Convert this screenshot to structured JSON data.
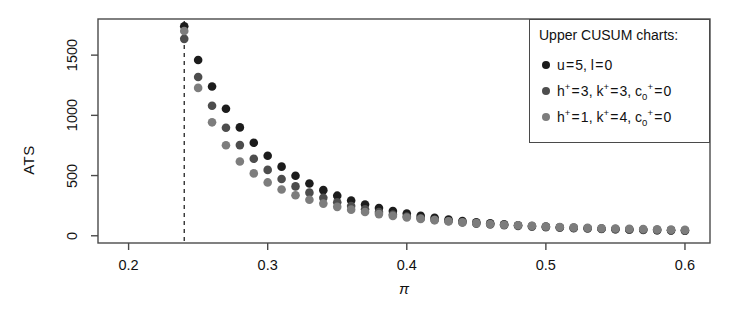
{
  "chart_data": {
    "type": "scatter",
    "title": "",
    "xlabel": "π",
    "ylabel": "ATS",
    "xlim": [
      0.178,
      0.618
    ],
    "ylim": [
      -60,
      1800
    ],
    "xticks": [
      0.2,
      0.3,
      0.4,
      0.5,
      0.6
    ],
    "xticklabels": [
      "0.2",
      "0.3",
      "0.4",
      "0.5",
      "0.6"
    ],
    "yticks": [
      0,
      500,
      1000,
      1500
    ],
    "yticklabels": [
      "0",
      "500",
      "1000",
      "1500"
    ],
    "grid": false,
    "legend_position": "top-right",
    "vline": {
      "x": 0.24,
      "style": "dashed",
      "color": "#222222"
    },
    "marker": "filled-circle",
    "marker_size": 6,
    "x": [
      0.24,
      0.25,
      0.26,
      0.27,
      0.28,
      0.29,
      0.3,
      0.31,
      0.32,
      0.33,
      0.34,
      0.35,
      0.36,
      0.37,
      0.38,
      0.39,
      0.4,
      0.41,
      0.42,
      0.43,
      0.44,
      0.45,
      0.46,
      0.47,
      0.48,
      0.49,
      0.5,
      0.51,
      0.52,
      0.53,
      0.54,
      0.55,
      0.56,
      0.57,
      0.58,
      0.59,
      0.6
    ],
    "series": [
      {
        "name": "u = 5, l = 0",
        "color": "#1c1c1c",
        "values": [
          1740,
          1460,
          1240,
          1055,
          900,
          772,
          664,
          574,
          498,
          434,
          379,
          333,
          293,
          259,
          230,
          205,
          184,
          165,
          149,
          135,
          123,
          112,
          103,
          95,
          88,
          81,
          76,
          71,
          66,
          62,
          59,
          55,
          52,
          50,
          47,
          45,
          43
        ]
      },
      {
        "name": "h+ = 3, k+ = 3, c0+ = 0",
        "color": "#4d4d4d",
        "values": [
          1635,
          1318,
          1080,
          897,
          753,
          639,
          547,
          472,
          410,
          358,
          315,
          278,
          247,
          220,
          197,
          177,
          160,
          145,
          132,
          120,
          110,
          101,
          94,
          87,
          81,
          76,
          71,
          67,
          63,
          60,
          57,
          54,
          51,
          49,
          47,
          45,
          43
        ]
      },
      {
        "name": "h+ = 1, k+ = 4, c0+ = 0",
        "color": "#7d7d7d",
        "values": [
          1700,
          1228,
          942,
          752,
          617,
          518,
          443,
          384,
          337,
          299,
          267,
          240,
          217,
          197,
          180,
          165,
          152,
          140,
          130,
          120,
          112,
          105,
          98,
          92,
          87,
          82,
          77,
          73,
          70,
          66,
          63,
          61,
          58,
          56,
          53,
          51,
          49
        ]
      }
    ]
  },
  "legend": {
    "title": "Upper CUSUM charts:",
    "entries": [
      {
        "dot_color": "#1c1c1c",
        "label": "u = 5, l = 0"
      },
      {
        "dot_color": "#4d4d4d",
        "label": "h+ = 3, k+ = 3, c0+ = 0"
      },
      {
        "dot_color": "#7d7d7d",
        "label": "h+ = 1, k+ = 4, c0+ = 0"
      }
    ]
  },
  "axes": {
    "x_title": "π",
    "y_title": "ATS"
  },
  "style": {
    "frame_color": "#4a4a4a",
    "background": "#ffffff",
    "text_color": "#111111"
  }
}
